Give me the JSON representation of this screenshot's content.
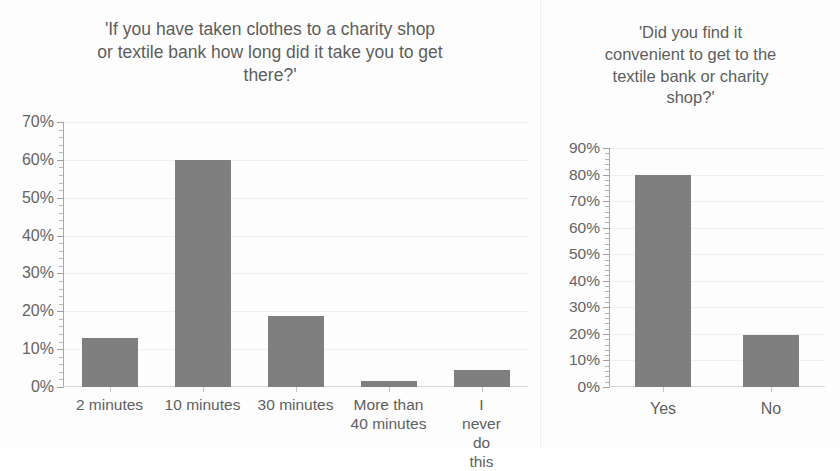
{
  "page": {
    "background_color": "#fdfdfd",
    "bar_color": "#7f7f7f",
    "gridline_color": "#f0f0f0",
    "axis_color": "#a8a8a8",
    "text_color": "#5d5d5d"
  },
  "charts": {
    "left": {
      "title": "'If you have taken clothes to a charity shop\nor textile bank how long did it take you to get\nthere?'",
      "y_ticks": [
        "0%",
        "10%",
        "20%",
        "30%",
        "40%",
        "50%",
        "60%",
        "70%"
      ],
      "x_labels": [
        "2 minutes",
        "10 minutes",
        "30 minutes",
        "More than\n40 minutes",
        "I never do\nthis"
      ]
    },
    "right": {
      "title": "'Did you find it\nconvenient to get to the\ntextile bank or charity\nshop?'",
      "y_ticks": [
        "0%",
        "10%",
        "20%",
        "30%",
        "40%",
        "50%",
        "60%",
        "70%",
        "80%",
        "90%"
      ],
      "x_labels": [
        "Yes",
        "No"
      ]
    }
  },
  "chart_data": [
    {
      "type": "bar",
      "title": "'If you have taken clothes to a charity shop or textile bank how long did it take you to get there?'",
      "xlabel": "",
      "ylabel": "",
      "categories": [
        "2 minutes",
        "10 minutes",
        "30 minutes",
        "More than 40 minutes",
        "I never do this"
      ],
      "values": [
        13,
        60,
        18.7,
        1.5,
        4.5
      ],
      "ylim": [
        0,
        70
      ],
      "ytick_step": 10,
      "ytick_format": "percent",
      "minor_ticks_per_interval": 5,
      "grid": true,
      "grid_axis": "y",
      "legend": false,
      "bar_color": "#7f7f7f"
    },
    {
      "type": "bar",
      "title": "'Did you find it convenient to get to the textile bank or charity shop?'",
      "xlabel": "",
      "ylabel": "",
      "categories": [
        "Yes",
        "No"
      ],
      "values": [
        80,
        19.5
      ],
      "ylim": [
        0,
        90
      ],
      "ytick_step": 10,
      "ytick_format": "percent",
      "minor_ticks_per_interval": 5,
      "grid": true,
      "grid_axis": "y",
      "legend": false,
      "bar_color": "#7f7f7f"
    }
  ]
}
